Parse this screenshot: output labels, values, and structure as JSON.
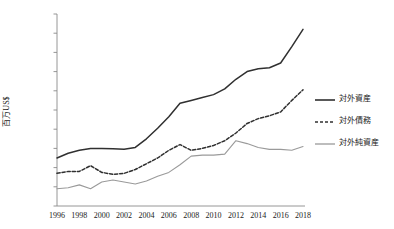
{
  "chart_data": {
    "type": "line",
    "title": "",
    "xlabel": "",
    "ylabel": "百万US$",
    "ylim": [
      0,
      10000000
    ],
    "xlim": [
      1996,
      2018
    ],
    "grid": false,
    "legend_position": "right",
    "ytick_labels": [
      "10000000",
      "9000000",
      "8000000",
      "7000000",
      "6000000",
      "5000000",
      "4000000",
      "3000000",
      "2000000",
      "1000000",
      "0"
    ],
    "ytick_values": [
      10000000,
      9000000,
      8000000,
      7000000,
      6000000,
      5000000,
      4000000,
      3000000,
      2000000,
      1000000,
      0
    ],
    "xtick_labels": [
      "1996",
      "1998",
      "2000",
      "2002",
      "2004",
      "2006",
      "2008",
      "2010",
      "2012",
      "2014",
      "2016",
      "2018"
    ],
    "xtick_values": [
      1996,
      1998,
      2000,
      2002,
      2004,
      2006,
      2008,
      2010,
      2012,
      2014,
      2016,
      2018
    ],
    "x": [
      1996,
      1997,
      1998,
      1999,
      2000,
      2001,
      2002,
      2003,
      2004,
      2005,
      2006,
      2007,
      2008,
      2009,
      2010,
      2011,
      2012,
      2013,
      2014,
      2015,
      2016,
      2017,
      2018
    ],
    "series": [
      {
        "name": "対外資産",
        "style": "solid",
        "color": "#303030",
        "values": [
          2500000,
          2750000,
          2900000,
          3000000,
          3000000,
          2980000,
          2950000,
          3050000,
          3500000,
          4050000,
          4650000,
          5350000,
          5500000,
          5650000,
          5800000,
          6100000,
          6600000,
          7000000,
          7150000,
          7200000,
          7450000,
          8300000,
          9200000
        ]
      },
      {
        "name": "対外債務",
        "style": "dashed",
        "color": "#303030",
        "values": [
          1700000,
          1800000,
          1800000,
          2100000,
          1750000,
          1650000,
          1700000,
          1900000,
          2200000,
          2500000,
          2900000,
          3200000,
          2900000,
          3000000,
          3150000,
          3400000,
          3800000,
          4300000,
          4550000,
          4700000,
          4900000,
          5500000,
          6050000
        ]
      },
      {
        "name": "対外純資産",
        "style": "solid-light",
        "color": "#9a9a9a",
        "values": [
          900000,
          950000,
          1100000,
          900000,
          1250000,
          1350000,
          1250000,
          1150000,
          1300000,
          1550000,
          1750000,
          2150000,
          2600000,
          2650000,
          2650000,
          2700000,
          3400000,
          3250000,
          3050000,
          2950000,
          2950000,
          2900000,
          3100000
        ]
      }
    ]
  },
  "legend": {
    "items": [
      {
        "label": "対外資産"
      },
      {
        "label": "対外債務"
      },
      {
        "label": "対外純資産"
      }
    ]
  }
}
